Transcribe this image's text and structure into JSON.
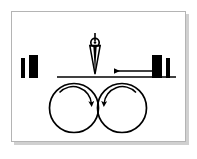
{
  "figure": {
    "frame": {
      "border_color": "#b4b4b4",
      "background_color": "#ffffff",
      "shadow_color": "#aaaaaa",
      "x": 11,
      "y": 11,
      "width": 175,
      "height": 131
    },
    "ink_color": "#000000",
    "rollers": [
      {
        "name": "left-roller",
        "cx": 74,
        "cy": 108,
        "r": 24.5,
        "rotation": "clockwise",
        "arrow_label": ""
      },
      {
        "name": "right-roller",
        "cx": 122,
        "cy": 108,
        "r": 24.5,
        "rotation": "counter-clockwise",
        "arrow_label": ""
      }
    ],
    "web": {
      "name": "web-line",
      "x1": 57,
      "x2": 176,
      "y": 77,
      "thickness": 1.4
    },
    "feed_arrow": {
      "name": "feed-direction-arrow",
      "direction": "left",
      "x_tail": 155,
      "x_head": 112,
      "y": 71,
      "label": ""
    },
    "nozzle": {
      "name": "nozzle-applicator",
      "tip_x": 95,
      "tip_y": 74,
      "top_y": 33,
      "collar_cy": 42,
      "collar_r": 4.2,
      "half_width": 5.4,
      "label": ""
    },
    "bars_left": [
      {
        "name": "left-blade-thin",
        "x": 21,
        "y": 58,
        "width": 4,
        "height": 20
      },
      {
        "name": "left-blade-thick",
        "x": 29,
        "y": 55,
        "width": 9,
        "height": 23
      }
    ],
    "bars_right": [
      {
        "name": "right-blade-thick",
        "x": 152,
        "y": 55,
        "width": 10,
        "height": 23
      },
      {
        "name": "right-blade-thin",
        "x": 166,
        "y": 58,
        "width": 4,
        "height": 20
      }
    ],
    "annotations": []
  }
}
